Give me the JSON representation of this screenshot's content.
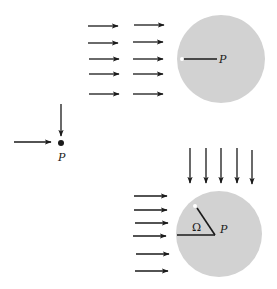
{
  "diagram": {
    "colors": {
      "arrow": "#1a1a1a",
      "sphere_fill": "#d2d2d2",
      "white_dot": "#ffffff"
    },
    "point_panel": {
      "label": "P",
      "arrows": [
        {
          "x1": 14,
          "y1": 142,
          "x2": 51,
          "y2": 142
        },
        {
          "x1": 61,
          "y1": 104,
          "x2": 61,
          "y2": 136
        }
      ],
      "dot": {
        "cx": 61,
        "cy": 143,
        "r": 3
      }
    },
    "top_sphere": {
      "label": "P",
      "circle": {
        "cx": 221,
        "cy": 59,
        "r": 44
      },
      "radius_line": {
        "x1": 183,
        "y1": 59,
        "x2": 217,
        "y2": 59
      },
      "white_dot": {
        "cx": 182,
        "cy": 59
      },
      "label_pos": {
        "x": 219,
        "y": 63
      },
      "arrows": [
        {
          "x1": 88,
          "y1": 26,
          "x2": 118,
          "y2": 26
        },
        {
          "x1": 88,
          "y1": 43,
          "x2": 118,
          "y2": 43
        },
        {
          "x1": 89,
          "y1": 59,
          "x2": 119,
          "y2": 59
        },
        {
          "x1": 89,
          "y1": 74,
          "x2": 119,
          "y2": 74
        },
        {
          "x1": 89,
          "y1": 94,
          "x2": 119,
          "y2": 94
        },
        {
          "x1": 134,
          "y1": 25,
          "x2": 164,
          "y2": 25
        },
        {
          "x1": 133,
          "y1": 42,
          "x2": 163,
          "y2": 42
        },
        {
          "x1": 133,
          "y1": 59,
          "x2": 163,
          "y2": 59
        },
        {
          "x1": 133,
          "y1": 74,
          "x2": 163,
          "y2": 74
        },
        {
          "x1": 133,
          "y1": 94,
          "x2": 163,
          "y2": 94
        }
      ]
    },
    "bottom_sphere": {
      "label": "P",
      "angle_label": "Ω",
      "circle": {
        "cx": 219,
        "cy": 234,
        "r": 43
      },
      "horizontal_line": {
        "x1": 177,
        "y1": 235,
        "x2": 215,
        "y2": 235
      },
      "diagonal_line": {
        "x1": 215,
        "y1": 235,
        "x2": 197,
        "y2": 208
      },
      "white_dot": {
        "cx": 195,
        "cy": 206
      },
      "label_pos": {
        "x": 220,
        "y": 233
      },
      "angle_label_pos": {
        "x": 192,
        "y": 231
      },
      "left_arrows": [
        {
          "x1": 134,
          "y1": 196,
          "x2": 167,
          "y2": 196
        },
        {
          "x1": 134,
          "y1": 210,
          "x2": 167,
          "y2": 210
        },
        {
          "x1": 135,
          "y1": 223,
          "x2": 168,
          "y2": 223
        },
        {
          "x1": 133,
          "y1": 236,
          "x2": 166,
          "y2": 236
        },
        {
          "x1": 136,
          "y1": 254,
          "x2": 169,
          "y2": 254
        },
        {
          "x1": 135,
          "y1": 271,
          "x2": 168,
          "y2": 271
        }
      ],
      "top_arrows": [
        {
          "x1": 190,
          "y1": 148,
          "x2": 190,
          "y2": 183
        },
        {
          "x1": 206,
          "y1": 148,
          "x2": 206,
          "y2": 183
        },
        {
          "x1": 221,
          "y1": 148,
          "x2": 221,
          "y2": 183
        },
        {
          "x1": 237,
          "y1": 148,
          "x2": 237,
          "y2": 183
        },
        {
          "x1": 252,
          "y1": 150,
          "x2": 252,
          "y2": 184
        }
      ]
    }
  }
}
